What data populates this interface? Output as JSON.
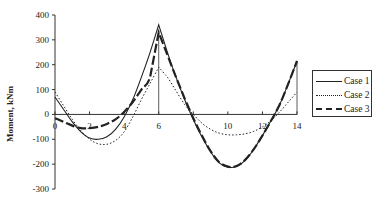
{
  "chart_data": {
    "type": "line",
    "title": "",
    "xlabel": "",
    "ylabel": "Moment, kNm",
    "xlim": [
      0,
      14
    ],
    "ylim": [
      -300,
      400
    ],
    "xticks": [
      0,
      2,
      4,
      6,
      8,
      10,
      12,
      14
    ],
    "xtick_labels": [
      "0",
      "2",
      "4",
      "6",
      "",
      "10",
      "12",
      "14"
    ],
    "yticks": [
      400,
      300,
      200,
      100,
      0,
      -100,
      -200,
      -300
    ],
    "ytick_labels": [
      "400",
      "300",
      "200",
      "100",
      "0",
      "-100",
      "-200",
      "-300"
    ],
    "grid": false,
    "legend_position": "right",
    "series": [
      {
        "name": "Case 1",
        "style": "solid",
        "x": [
          0,
          0.5,
          1,
          1.5,
          2,
          2.5,
          3,
          3.5,
          4,
          4.5,
          5,
          5.5,
          6,
          6.5,
          7,
          7.5,
          8,
          8.5,
          9,
          9.5,
          10,
          10.5,
          11,
          11.5,
          12,
          12.5,
          13,
          13.5,
          14
        ],
        "y": [
          70,
          20,
          -30,
          -70,
          -95,
          -100,
          -90,
          -60,
          -10,
          60,
          150,
          250,
          360,
          250,
          150,
          60,
          -20,
          -90,
          -150,
          -195,
          -212,
          -210,
          -185,
          -140,
          -85,
          -25,
          40,
          125,
          215
        ]
      },
      {
        "name": "Case 2",
        "style": "dotted",
        "x": [
          0,
          0.5,
          1,
          1.5,
          2,
          2.5,
          3,
          3.5,
          4,
          4.5,
          5,
          5.5,
          6,
          6.5,
          7,
          7.5,
          8,
          8.5,
          9,
          9.5,
          10,
          10.5,
          11,
          11.5,
          12,
          12.5,
          13,
          13.5,
          14
        ],
        "y": [
          90,
          35,
          -20,
          -65,
          -100,
          -118,
          -120,
          -105,
          -70,
          -10,
          60,
          125,
          190,
          150,
          95,
          40,
          0,
          -35,
          -60,
          -75,
          -82,
          -82,
          -78,
          -68,
          -50,
          -25,
          10,
          50,
          90
        ]
      },
      {
        "name": "Case 3",
        "style": "dashed",
        "x": [
          0,
          0.5,
          1,
          1.5,
          2,
          2.5,
          3,
          3.5,
          4,
          4.5,
          5,
          5.5,
          6,
          6.5,
          7,
          7.5,
          8,
          8.5,
          9,
          9.5,
          10,
          10.5,
          11,
          11.5,
          12,
          12.5,
          13,
          13.5,
          14
        ],
        "y": [
          -15,
          -30,
          -45,
          -55,
          -55,
          -50,
          -38,
          -20,
          10,
          50,
          100,
          150,
          330,
          240,
          150,
          65,
          -15,
          -85,
          -148,
          -192,
          -210,
          -208,
          -183,
          -140,
          -85,
          -25,
          40,
          125,
          215
        ]
      }
    ]
  },
  "legend": {
    "items": [
      {
        "label": "Case 1",
        "style": "solid"
      },
      {
        "label": "Case 2",
        "style": "dotted"
      },
      {
        "label": "Case 3",
        "style": "dashed"
      }
    ]
  },
  "colors": {
    "line": "#222222",
    "axis": "#333333",
    "background": "#ffffff"
  }
}
